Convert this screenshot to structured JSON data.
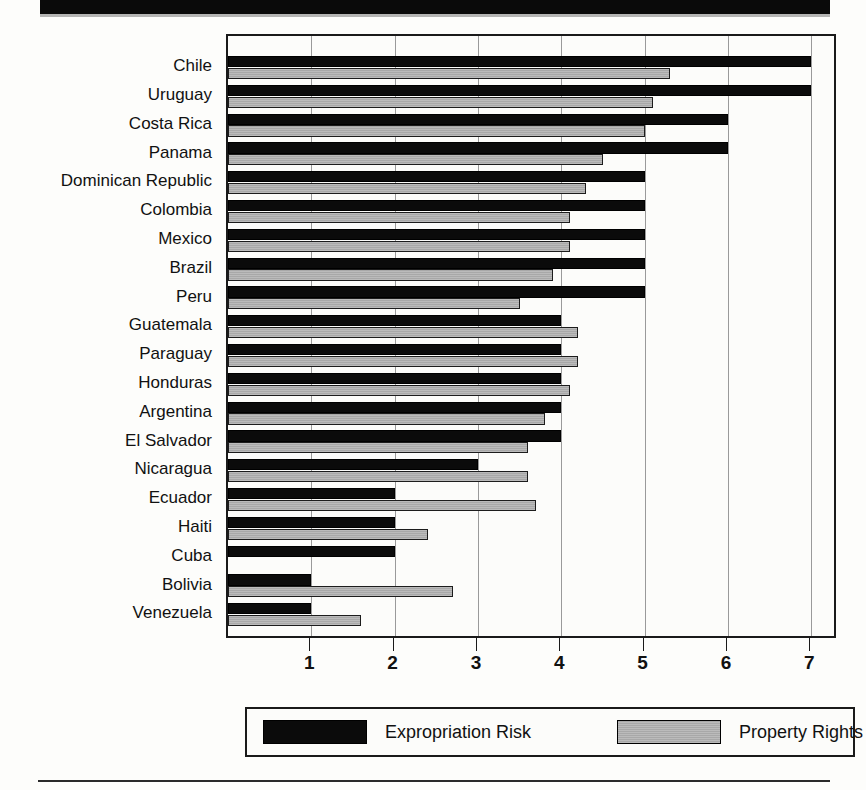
{
  "chart_data": {
    "type": "bar",
    "orientation": "horizontal",
    "title": "",
    "subtitle": "",
    "xlabel": "",
    "ylabel": "",
    "xlim": [
      0,
      7.32
    ],
    "xticks": [
      1,
      2,
      3,
      4,
      5,
      6,
      7
    ],
    "grid": true,
    "legend_position": "bottom",
    "categories": [
      "Chile",
      "Uruguay",
      "Costa Rica",
      "Panama",
      "Dominican Republic",
      "Colombia",
      "Mexico",
      "Brazil",
      "Peru",
      "Guatemala",
      "Paraguay",
      "Honduras",
      "Argentina",
      "El Salvador",
      "Nicaragua",
      "Ecuador",
      "Haiti",
      "Cuba",
      "Bolivia",
      "Venezuela"
    ],
    "series": [
      {
        "name": "Expropriation Risk",
        "color": "#0b0b0b",
        "values": [
          7.0,
          7.0,
          6.0,
          6.0,
          5.0,
          5.0,
          5.0,
          5.0,
          5.0,
          4.0,
          4.0,
          4.0,
          4.0,
          4.0,
          3.0,
          2.0,
          2.0,
          2.0,
          1.0,
          1.0
        ]
      },
      {
        "name": "Property Rights",
        "color": "#a8a8a8",
        "values": [
          5.3,
          5.1,
          5.0,
          4.5,
          4.3,
          4.1,
          4.1,
          3.9,
          3.5,
          4.2,
          4.2,
          4.1,
          3.8,
          3.6,
          3.6,
          3.7,
          2.4,
          0.0,
          2.7,
          1.6
        ]
      }
    ]
  },
  "legend": {
    "entries": [
      {
        "label": "Expropriation Risk",
        "swatch": "black"
      },
      {
        "label": "Property Rights",
        "swatch": "gray"
      }
    ]
  }
}
